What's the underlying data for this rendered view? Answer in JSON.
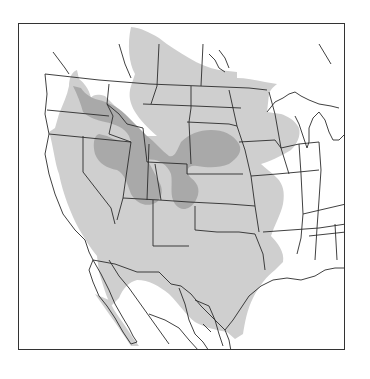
{
  "map": {
    "title": "Species range map — western and central North America",
    "region": "North America (USA, southern Canada, northern Mexico)",
    "legend": [],
    "colors": {
      "background": "#ffffff",
      "range_light": "#cfcfcf",
      "range_dark": "#a9a9a9",
      "borders": "#2b2b2b",
      "frame": "#333333"
    },
    "layers": [
      {
        "name": "range-light",
        "description": "Primary range (light grey) — Great Plains, Great Basin, California, Southwest, Texas, northern Mexico, Prairie Provinces"
      },
      {
        "name": "range-dark",
        "description": "Core/breeding range (dark grey) — Columbia Plateau, Snake River Plain, Utah/Nevada, Nebraska/South Dakota, eastern Colorado"
      }
    ]
  }
}
